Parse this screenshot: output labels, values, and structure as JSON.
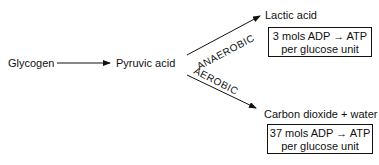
{
  "diagram": {
    "nodes": {
      "glycogen": "Glycogen",
      "pyruvic_acid": "Pyruvic acid",
      "lactic_acid": "Lactic acid",
      "co2_water": "Carbon dioxide + water"
    },
    "edges": {
      "anaerobic_label": "ANAEROBIC",
      "aerobic_label": "AEROBIC"
    },
    "boxes": {
      "anaerobic_yield_line1": "3 mols ADP → ATP",
      "anaerobic_yield_line2": "per glucose unit",
      "aerobic_yield_line1": "37 mols ADP → ATP",
      "aerobic_yield_line2": "per glucose unit"
    }
  }
}
